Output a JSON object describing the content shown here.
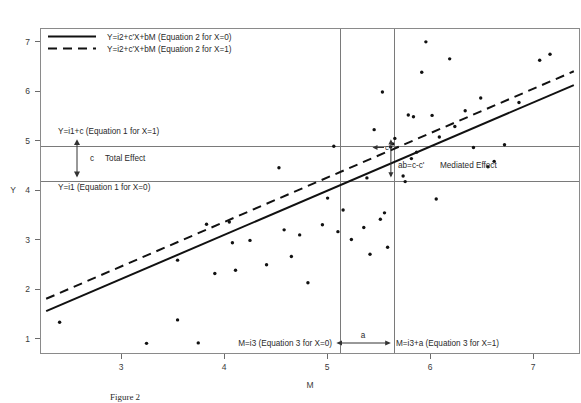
{
  "figure": {
    "caption": "Figure 2",
    "background_color": "#ffffff",
    "line_color": "#111111",
    "grid_color": "#7a7a7a"
  },
  "chart_data": {
    "type": "scatter",
    "title": "",
    "xlabel": "M",
    "ylabel": "Y",
    "xlim": [
      2.2,
      7.4
    ],
    "ylim": [
      0.55,
      7.6
    ],
    "xticks": [
      3,
      4,
      5,
      6,
      7
    ],
    "yticks": [
      1,
      2,
      3,
      4,
      5,
      6,
      7
    ],
    "grid": false,
    "legend_position": "top-left",
    "series": [
      {
        "name": "Y=i2+c'X+bM (Equation 2 for X=0)",
        "type": "line",
        "style": "solid",
        "x": [
          2.25,
          7.35
        ],
        "y": [
          1.46,
          6.38
        ]
      },
      {
        "name": "Y=i2+c'X+bM (Equation 2 for X=1)",
        "type": "line",
        "style": "dashed",
        "x": [
          2.25,
          7.35
        ],
        "y": [
          1.73,
          6.68
        ]
      },
      {
        "name": "observations",
        "type": "scatter",
        "points": [
          [
            2.38,
            1.22
          ],
          [
            3.22,
            0.76
          ],
          [
            3.52,
            1.27
          ],
          [
            3.52,
            2.57
          ],
          [
            3.72,
            0.77
          ],
          [
            3.8,
            3.35
          ],
          [
            3.88,
            2.28
          ],
          [
            4.02,
            3.4
          ],
          [
            4.05,
            2.95
          ],
          [
            4.08,
            2.35
          ],
          [
            4.22,
            3.0
          ],
          [
            4.38,
            2.47
          ],
          [
            4.5,
            4.58
          ],
          [
            4.55,
            3.23
          ],
          [
            4.62,
            2.65
          ],
          [
            4.7,
            3.12
          ],
          [
            4.78,
            2.08
          ],
          [
            4.92,
            3.34
          ],
          [
            4.97,
            3.92
          ],
          [
            5.03,
            5.05
          ],
          [
            5.07,
            3.19
          ],
          [
            5.12,
            3.66
          ],
          [
            5.2,
            3.02
          ],
          [
            5.32,
            3.28
          ],
          [
            5.35,
            4.36
          ],
          [
            5.38,
            2.7
          ],
          [
            5.42,
            5.41
          ],
          [
            5.48,
            3.46
          ],
          [
            5.5,
            6.23
          ],
          [
            5.52,
            3.6
          ],
          [
            5.55,
            2.85
          ],
          [
            5.58,
            5.03
          ],
          [
            5.6,
            5.1
          ],
          [
            5.62,
            5.22
          ],
          [
            5.7,
            4.4
          ],
          [
            5.72,
            4.28
          ],
          [
            5.75,
            5.73
          ],
          [
            5.78,
            4.78
          ],
          [
            5.8,
            5.69
          ],
          [
            5.83,
            4.92
          ],
          [
            5.88,
            6.66
          ],
          [
            5.92,
            7.32
          ],
          [
            5.98,
            5.72
          ],
          [
            6.02,
            3.9
          ],
          [
            6.05,
            5.25
          ],
          [
            6.15,
            6.95
          ],
          [
            6.2,
            5.48
          ],
          [
            6.3,
            5.82
          ],
          [
            6.38,
            5.02
          ],
          [
            6.45,
            6.1
          ],
          [
            6.52,
            4.6
          ],
          [
            6.58,
            4.72
          ],
          [
            6.68,
            5.08
          ],
          [
            6.82,
            6.0
          ],
          [
            7.02,
            6.92
          ],
          [
            7.12,
            7.05
          ]
        ]
      }
    ],
    "reference_lines": {
      "horizontal": [
        {
          "label_key": "y_low",
          "y": 4.28
        },
        {
          "label_key": "y_high",
          "y": 5.05
        }
      ],
      "vertical": [
        {
          "label_key": "m_low",
          "x": 5.09
        },
        {
          "label_key": "m_high",
          "x": 5.62
        }
      ]
    }
  },
  "legend": {
    "items": [
      {
        "label": "Y=i2+c'X+bM (Equation 2 for X=0)",
        "style": "solid"
      },
      {
        "label": "Y=i2+c'X+bM (Equation 2 for X=1)",
        "style": "dashed"
      }
    ]
  },
  "annotations": {
    "y_high_label": "Y=i1+c (Equation 1 for X=1)",
    "y_low_label": "Y=i1 (Equation 1 for X=0)",
    "total_effect_symbol": "c",
    "total_effect_label": "Total Effect",
    "mediated_effect_symbol": "ab=c-c'",
    "mediated_effect_label": "Mediated Effect",
    "direct_effect_symbol": "c'",
    "a_path_symbol": "a",
    "m_low_label": "M=i3 (Equation 3 for X=0)",
    "m_high_label": "M=i3+a (Equation 3 for X=1)"
  },
  "axes": {
    "x_title": "M",
    "y_title": "Y",
    "x_tick_labels": [
      "3",
      "4",
      "5",
      "6",
      "7"
    ],
    "y_tick_labels": [
      "1",
      "2",
      "3",
      "4",
      "5",
      "6",
      "7"
    ]
  }
}
